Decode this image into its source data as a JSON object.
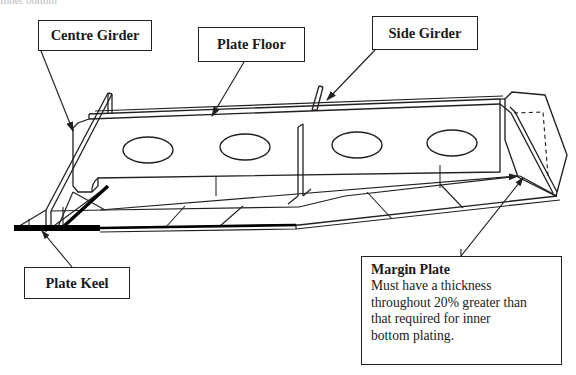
{
  "figure": {
    "kind": "engineering-diagram",
    "clipped_top_text": "Inner bottom"
  },
  "colors": {
    "line": "#231f20",
    "fill": "#ffffff",
    "keel_solid": "#000000",
    "text": "#1a1a1a"
  },
  "callouts": [
    {
      "id": "centre-girder",
      "title": "Centre Girder",
      "body": ""
    },
    {
      "id": "plate-floor",
      "title": "Plate Floor",
      "body": ""
    },
    {
      "id": "side-girder",
      "title": "Side Girder",
      "body": ""
    },
    {
      "id": "plate-keel",
      "title": "Plate Keel",
      "body": ""
    },
    {
      "id": "margin-plate",
      "title": "Margin Plate",
      "body": "Must have a thickness throughout 20% greater than that required for inner bottom plating."
    }
  ],
  "margin_plate_note": {
    "title": "Margin Plate",
    "line1": "Must have a thickness",
    "line2": "throughout 20% greater than",
    "line3": "that required for inner",
    "line4": "bottom plating."
  },
  "structure": {
    "lightening_holes_count": 4,
    "leader_arrows": 5
  }
}
